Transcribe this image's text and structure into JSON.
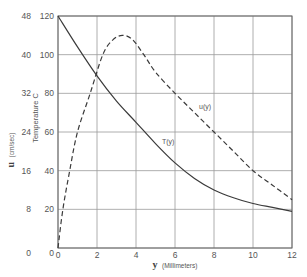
{
  "chart_data": {
    "type": "line",
    "title": "",
    "xlabel": "y (Millimeters)",
    "xlabel_symbol": "y",
    "xlabel_unit": "(Millimeters)",
    "ylabel_left_outer": "u (cm/sec)",
    "ylabel_left_outer_symbol": "u",
    "ylabel_left_outer_unit": "(cm/sec)",
    "ylabel_left_inner": "Temperature C",
    "xlim": [
      0,
      12
    ],
    "ylim_temperature": [
      0,
      120
    ],
    "ylim_velocity": [
      0,
      48
    ],
    "x_ticks": [
      "0",
      "2",
      "4",
      "6",
      "8",
      "10",
      "12"
    ],
    "temperature_ticks": [
      "0",
      "20",
      "40",
      "60",
      "80",
      "100",
      "120"
    ],
    "velocity_ticks": [
      "0",
      "8",
      "16",
      "24",
      "32",
      "40",
      "48"
    ],
    "grid": true,
    "legend": "inline curve labels",
    "series": [
      {
        "name": "T(y)",
        "label": "T(y)",
        "axis": "temperature",
        "style": "solid",
        "x": [
          0,
          1,
          2,
          3,
          4,
          5,
          6,
          7,
          8,
          9,
          10,
          11,
          12
        ],
        "values": [
          120,
          104,
          89,
          76,
          65,
          54,
          44,
          36,
          30,
          26,
          23,
          21,
          19
        ]
      },
      {
        "name": "u(y)",
        "label": "u(y)",
        "axis": "velocity",
        "style": "dashed",
        "x": [
          0,
          0.25,
          0.6,
          1.0,
          1.65,
          2.3,
          2.8,
          3.3,
          3.8,
          4.4,
          5,
          6,
          7,
          8,
          9,
          10,
          11,
          12
        ],
        "values": [
          0,
          8,
          16,
          24,
          32,
          40,
          43,
          44,
          43.2,
          40,
          36.4,
          32,
          28,
          24,
          20,
          16,
          13,
          10
        ]
      }
    ],
    "annotations": [
      {
        "text": "T(y)",
        "x": 5.5,
        "y_temperature": 55
      },
      {
        "text": "u(y)",
        "x": 7.3,
        "y_temperature": 73
      }
    ]
  }
}
